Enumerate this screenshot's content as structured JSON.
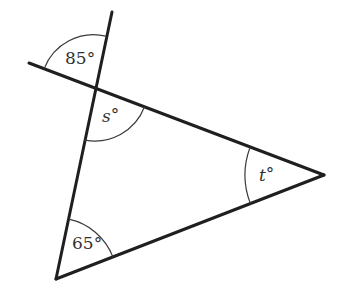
{
  "figure": {
    "points": {
      "top_vertex": [
        95,
        88
      ],
      "right_vertex": [
        324,
        175
      ],
      "bottom_vertex": [
        56,
        279
      ],
      "extension_up_end": [
        112,
        12
      ],
      "extension_left_end": [
        29,
        63
      ]
    },
    "angles": [
      {
        "id": "exterior_vertical",
        "label": "85°",
        "value": 85,
        "unit": "degrees",
        "at": "top_vertex",
        "position": "vertical angle above-left of intersection"
      },
      {
        "id": "s",
        "label": "s°",
        "variable": "s",
        "at": "top_vertex",
        "position": "interior angle of triangle"
      },
      {
        "id": "t",
        "label": "t°",
        "variable": "t",
        "at": "right_vertex",
        "position": "interior angle of triangle"
      },
      {
        "id": "bottom",
        "label": "65°",
        "value": 65,
        "unit": "degrees",
        "at": "bottom_vertex",
        "position": "interior angle of triangle"
      }
    ],
    "labels": {
      "angle_85": "85°",
      "angle_s_var": "s",
      "angle_t_var": "t",
      "degree": "°",
      "angle_65": "65°"
    },
    "colors": {
      "line": "#1f1f1f",
      "arc": "#3a3a3a",
      "text": "#333333",
      "background": "#ffffff"
    }
  }
}
